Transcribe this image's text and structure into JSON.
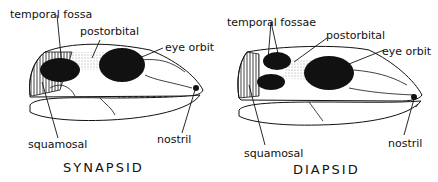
{
  "diagrams": [
    {
      "title": "SYNAPSID",
      "labels": {
        "temporal": "temporal fossa",
        "postorbital": "postorbital",
        "eye_orbit": "eye orbit",
        "squamosal": "squamosal",
        "nostril": "nostril"
      }
    },
    {
      "title": "DIAPSID",
      "labels": {
        "temporal": "temporal fossae",
        "postorbital": "postorbital",
        "eye_orbit": "eye orbit",
        "squamosal": "squamosal",
        "nostril": "nostril"
      }
    }
  ],
  "colors": {
    "ink": "#111111",
    "background": "#ffffff"
  }
}
